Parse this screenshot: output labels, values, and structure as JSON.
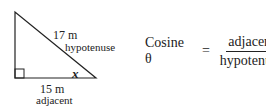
{
  "diagram": {
    "triangle": {
      "hypotenuse": {
        "length": "17 m",
        "name": "hypotenuse"
      },
      "adjacent": {
        "length": "15 m",
        "name": "adjacent"
      },
      "angle_label": "x",
      "right_angle_marker": true
    },
    "formula": {
      "lhs": "Cosine θ",
      "equals": "=",
      "numerator": "adjacent",
      "denominator": "hypotenuse"
    }
  }
}
